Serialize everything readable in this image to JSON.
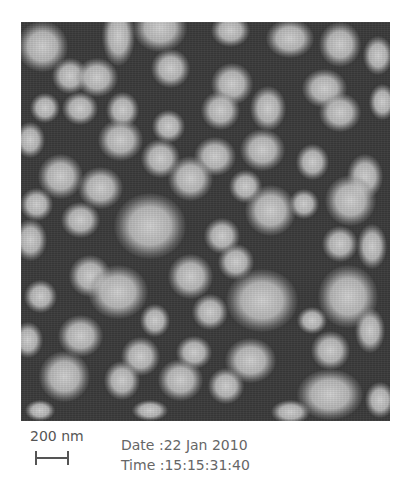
{
  "figure": {
    "type": "SEM micrograph of nanoparticles",
    "scale_bar": {
      "label": "200 nm"
    },
    "date_line": "Date :22 Jan 2010",
    "time_line": "Time :15:15:31:40"
  },
  "colors": {
    "background": "#3a3a3a",
    "particle": "#d0d0d0",
    "caption_text": "#666666"
  },
  "particles": [
    [
      42,
      46,
      34,
      34
    ],
    [
      118,
      36,
      22,
      40
    ],
    [
      160,
      28,
      36,
      32
    ],
    [
      230,
      30,
      26,
      22
    ],
    [
      290,
      38,
      32,
      26
    ],
    [
      340,
      44,
      28,
      30
    ],
    [
      378,
      55,
      20,
      26
    ],
    [
      70,
      76,
      24,
      24
    ],
    [
      97,
      77,
      28,
      26
    ],
    [
      170,
      68,
      26,
      26
    ],
    [
      232,
      84,
      28,
      28
    ],
    [
      324,
      88,
      30,
      26
    ],
    [
      382,
      102,
      18,
      24
    ],
    [
      45,
      108,
      20,
      20
    ],
    [
      80,
      108,
      24,
      22
    ],
    [
      122,
      110,
      22,
      24
    ],
    [
      168,
      126,
      22,
      22
    ],
    [
      220,
      110,
      26,
      26
    ],
    [
      268,
      108,
      24,
      30
    ],
    [
      340,
      112,
      28,
      26
    ],
    [
      30,
      140,
      20,
      24
    ],
    [
      120,
      140,
      30,
      28
    ],
    [
      160,
      158,
      26,
      26
    ],
    [
      215,
      156,
      28,
      26
    ],
    [
      262,
      150,
      30,
      28
    ],
    [
      312,
      162,
      22,
      24
    ],
    [
      365,
      176,
      24,
      30
    ],
    [
      60,
      176,
      30,
      30
    ],
    [
      100,
      188,
      30,
      28
    ],
    [
      190,
      178,
      30,
      30
    ],
    [
      245,
      186,
      22,
      22
    ],
    [
      304,
      204,
      20,
      20
    ],
    [
      350,
      200,
      34,
      34
    ],
    [
      36,
      204,
      22,
      22
    ],
    [
      80,
      220,
      26,
      24
    ],
    [
      150,
      226,
      48,
      44
    ],
    [
      222,
      236,
      24,
      24
    ],
    [
      270,
      210,
      34,
      34
    ],
    [
      340,
      244,
      24,
      24
    ],
    [
      372,
      246,
      20,
      30
    ],
    [
      30,
      240,
      22,
      28
    ],
    [
      90,
      276,
      28,
      28
    ],
    [
      190,
      276,
      30,
      30
    ],
    [
      236,
      262,
      24,
      24
    ],
    [
      262,
      300,
      48,
      42
    ],
    [
      348,
      296,
      40,
      42
    ],
    [
      40,
      296,
      22,
      22
    ],
    [
      118,
      292,
      40,
      36
    ],
    [
      210,
      312,
      24,
      24
    ],
    [
      155,
      320,
      20,
      22
    ],
    [
      312,
      320,
      20,
      18
    ],
    [
      28,
      340,
      20,
      24
    ],
    [
      80,
      336,
      30,
      28
    ],
    [
      140,
      356,
      26,
      26
    ],
    [
      194,
      352,
      24,
      22
    ],
    [
      250,
      360,
      34,
      30
    ],
    [
      330,
      350,
      26,
      26
    ],
    [
      370,
      330,
      20,
      30
    ],
    [
      64,
      376,
      34,
      34
    ],
    [
      122,
      380,
      24,
      26
    ],
    [
      180,
      380,
      30,
      28
    ],
    [
      226,
      386,
      24,
      24
    ],
    [
      330,
      394,
      44,
      34
    ],
    [
      380,
      400,
      20,
      24
    ],
    [
      40,
      410,
      20,
      14
    ],
    [
      150,
      410,
      24,
      14
    ],
    [
      290,
      412,
      26,
      16
    ]
  ]
}
